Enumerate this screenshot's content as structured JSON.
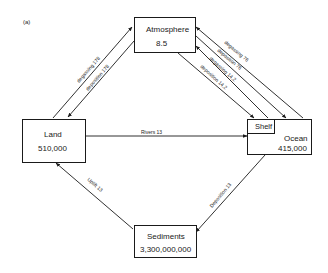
{
  "panel_label": "(a)",
  "reservoirs": {
    "atmosphere": {
      "name": "Atmosphere",
      "value": "8.5"
    },
    "land": {
      "name": "Land",
      "value": "510,000"
    },
    "ocean": {
      "name": "Ocean",
      "value": "415,000",
      "sub_box": "Shelf"
    },
    "sediments": {
      "name": "Sediments",
      "value": "3,300,000,000"
    }
  },
  "flows": {
    "land_to_atm": {
      "label": "degassing",
      "value": "178"
    },
    "atm_to_land": {
      "label": "deposition",
      "value": "178"
    },
    "ocean_to_atm": {
      "label": "degassing",
      "value": "76"
    },
    "atm_to_ocean": {
      "label": "deposition",
      "value": "76"
    },
    "shelf_to_atm": {
      "label": "degassing",
      "value": "14.2"
    },
    "atm_to_shelf": {
      "label": "deposition",
      "value": "14.2"
    },
    "land_to_ocean": {
      "label": "Rivers",
      "value": "13"
    },
    "ocean_to_sediments": {
      "label": "Deposition",
      "value": "13"
    },
    "sediments_to_land": {
      "label": "Uplift",
      "value": "13"
    }
  },
  "flow_labels": {
    "land_to_atm": "degassing  178",
    "atm_to_land": "deposition  178",
    "ocean_to_atm": "degassing  76",
    "atm_to_ocean": "deposition  76",
    "shelf_to_atm": "degassing  14.2",
    "atm_to_shelf": "deposition  14.2",
    "land_to_ocean": "Rivers   13",
    "ocean_to_sediments": "Deposition  13",
    "sediments_to_land": "Uplift   13"
  }
}
